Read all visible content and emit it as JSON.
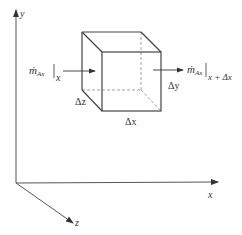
{
  "diagram": {
    "axes": {
      "x_label": "x",
      "y_label": "y",
      "z_label": "z"
    },
    "cube": {
      "dx_label": "Δx",
      "dy_label": "Δy",
      "dz_label": "Δz"
    },
    "inflow": {
      "symbol": "ṁ",
      "subscript": "Ax",
      "eval_at": "x"
    },
    "outflow": {
      "symbol": "ṁ",
      "subscript": "Ax",
      "eval_at": "x + Δx"
    },
    "colors": {
      "line": "#444444",
      "dashed": "#888888",
      "text": "#333333"
    }
  }
}
